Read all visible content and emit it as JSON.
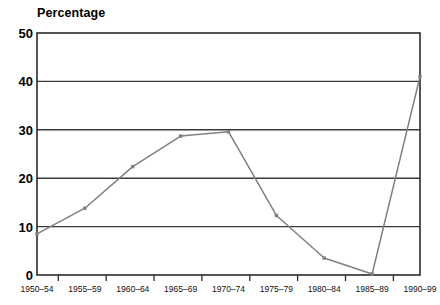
{
  "chart_data": {
    "type": "line",
    "title": "",
    "ylabel": "Percentage",
    "xlabel": "",
    "categories": [
      "1950–54",
      "1955–59",
      "1960–64",
      "1965–69",
      "1970–74",
      "1975–79",
      "1980–84",
      "1985–89",
      "1990–99"
    ],
    "values": [
      8.5,
      13.8,
      22.4,
      28.7,
      29.6,
      12.3,
      3.5,
      0.2,
      41.0
    ],
    "ylim": [
      0,
      50
    ],
    "yticks": [
      0,
      10,
      20,
      30,
      40,
      50
    ],
    "ytick_labels": [
      "0",
      "10",
      "20",
      "30",
      "40",
      "50"
    ],
    "grid": true,
    "legend": false,
    "series_color": "#808080",
    "marker": "square",
    "marker_color": "#808080",
    "axis_color": "#333333",
    "grid_color": "#444444",
    "background": "#ffffff"
  },
  "plot": {
    "left": 37,
    "right": 420,
    "top": 33,
    "bottom": 275
  }
}
